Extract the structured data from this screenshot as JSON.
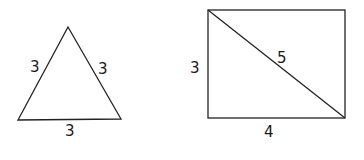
{
  "diagram": {
    "triangle": {
      "shape": "equilateral triangle",
      "vertices": [
        [
          68,
          27
        ],
        [
          18,
          120
        ],
        [
          121,
          119
        ]
      ],
      "side_labels": {
        "left": "3",
        "right": "3",
        "bottom": "3"
      }
    },
    "rectangle": {
      "shape": "rectangle with diagonal",
      "corners": [
        [
          208,
          10
        ],
        [
          345,
          10
        ],
        [
          345,
          118
        ],
        [
          208,
          118
        ]
      ],
      "side_labels": {
        "left": "3",
        "diagonal": "5",
        "bottom": "4"
      }
    },
    "colors": {
      "stroke": "#222222",
      "text": "#1a1a1a",
      "background": "#ffffff"
    }
  }
}
